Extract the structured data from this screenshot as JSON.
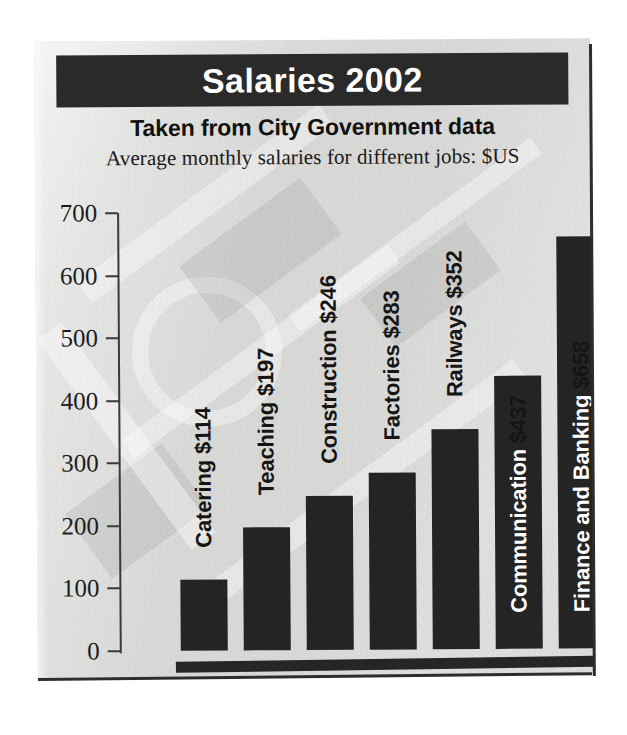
{
  "figure": {
    "title": "Salaries 2002",
    "subtitle": "Taken from City Government data",
    "caption": "Average monthly salaries for different jobs: $US"
  },
  "colors": {
    "title_bar_background": "#2a2a2a",
    "title_text": "#ffffff",
    "panel_background": "#d8d8d6",
    "bar_fill": "#242424",
    "axis": "#3a3a3a",
    "label_dark": "#151515",
    "label_light": "#ffffff"
  },
  "axis": {
    "y_ticks": [
      "700",
      "600",
      "500",
      "400",
      "300",
      "200",
      "100",
      "0"
    ]
  },
  "bars": [
    {
      "label": "Catering $114",
      "job": "Catering",
      "value": 114,
      "label_color": "dark"
    },
    {
      "label": "Teaching $197",
      "job": "Teaching",
      "value": 197,
      "label_color": "dark"
    },
    {
      "label": "Construction $246",
      "job": "Construction",
      "value": 246,
      "label_color": "dark"
    },
    {
      "label": "Factories $283",
      "job": "Factories",
      "value": 283,
      "label_color": "dark"
    },
    {
      "label": "Railways $352",
      "job": "Railways",
      "value": 352,
      "label_color": "dark"
    },
    {
      "label": "Communication $437",
      "job": "Communication",
      "value": 437,
      "label_color": "split",
      "inside_text": "Communication",
      "outside_text": " $437"
    },
    {
      "label": "Finance and Banking $658",
      "job": "Finance and Banking",
      "value": 658,
      "label_color": "split",
      "inside_text": "Finance and Banking",
      "outside_text": " $658"
    }
  ],
  "chart_data": {
    "type": "bar",
    "title": "Salaries 2002",
    "subtitle": "Taken from City Government data",
    "caption": "Average monthly salaries for different jobs: $US",
    "xlabel": "",
    "ylabel": "",
    "categories": [
      "Catering",
      "Teaching",
      "Construction",
      "Factories",
      "Railways",
      "Communication",
      "Finance and Banking"
    ],
    "values": [
      114,
      197,
      246,
      283,
      352,
      437,
      658
    ],
    "data_labels": [
      "Catering $114",
      "Teaching $197",
      "Construction $246",
      "Factories $283",
      "Railways $352",
      "Communication $437",
      "Finance and Banking $658"
    ],
    "units": "$US per month",
    "ylim": [
      0,
      700
    ],
    "ytick_values": [
      0,
      100,
      200,
      300,
      400,
      500,
      600,
      700
    ],
    "ytick_labels": [
      "0",
      "100",
      "200",
      "300",
      "400",
      "500",
      "600",
      "700"
    ],
    "grid": false,
    "legend": false,
    "legend_position": "none",
    "orientation": "vertical",
    "bar_color": "#242424",
    "background_color": "#d8d8d6"
  }
}
